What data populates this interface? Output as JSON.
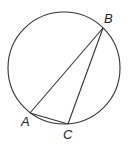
{
  "diagram": {
    "type": "circle-inscribed-triangle",
    "circle": {
      "cx": 64,
      "cy": 68,
      "r": 56
    },
    "points": {
      "A": {
        "label": "A",
        "x": 30,
        "y": 113,
        "label_x": 21,
        "label_y": 126
      },
      "B": {
        "label": "B",
        "x": 103,
        "y": 28,
        "label_x": 104,
        "label_y": 23
      },
      "C": {
        "label": "C",
        "x": 68,
        "y": 124,
        "label_x": 63,
        "label_y": 139
      }
    },
    "segments": [
      "AB",
      "BC",
      "AC"
    ],
    "colors": {
      "stroke": "#333333",
      "background": "#ffffff"
    }
  }
}
